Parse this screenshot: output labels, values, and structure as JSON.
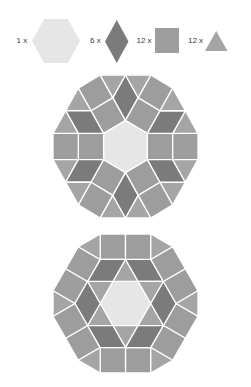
{
  "colors": {
    "hexagon": "#e6e6e6",
    "rhombus": "#7b7b7b",
    "square": "#9d9d9d",
    "triangle": "#a5a5a5",
    "gap": "#ffffff"
  },
  "legend": {
    "items": [
      {
        "count_label": "1 x",
        "count": 1,
        "shape": "hexagon"
      },
      {
        "count_label": "6 x",
        "count": 6,
        "shape": "rhombus"
      },
      {
        "count_label": "12 x",
        "count": 12,
        "shape": "square"
      },
      {
        "count_label": "12 x",
        "count": 12,
        "shape": "triangle"
      }
    ]
  },
  "figures": [
    {
      "name": "dodecagon-dissection-1",
      "description": "Pointy-top hexagon in center, squares on its edges, rhombi at its vertices, outer ring of squares and triangles",
      "rotations": 6,
      "hexagon": [
        [
          0,
          1
        ],
        [
          0.866,
          0.5
        ],
        [
          0.866,
          -0.5
        ],
        [
          0,
          -1
        ],
        [
          -0.866,
          -0.5
        ],
        [
          -0.866,
          0.5
        ]
      ],
      "sector": [
        {
          "shape": "square",
          "points": [
            [
              -0.866,
              0.5
            ],
            [
              0,
              1
            ],
            [
              -0.5,
              1.866
            ],
            [
              -1.366,
              1.366
            ]
          ]
        },
        {
          "shape": "rhombus",
          "points": [
            [
              0,
              1
            ],
            [
              0.5,
              1.866
            ],
            [
              0,
              2.732
            ],
            [
              -0.5,
              1.866
            ]
          ]
        },
        {
          "shape": "square",
          "points": [
            [
              -1.366,
              1.366
            ],
            [
              -0.5,
              1.866
            ],
            [
              -1,
              2.732
            ],
            [
              -1.866,
              2.232
            ]
          ]
        },
        {
          "shape": "triangle",
          "points": [
            [
              -0.5,
              1.866
            ],
            [
              0,
              2.732
            ],
            [
              -1,
              2.732
            ]
          ]
        },
        {
          "shape": "triangle",
          "points": [
            [
              -2.366,
              1.366
            ],
            [
              -1.366,
              1.366
            ],
            [
              -1.866,
              2.232
            ]
          ]
        }
      ]
    },
    {
      "name": "dodecagon-dissection-2",
      "description": "Flat-top hexagon in center with triangles forming a star, rhombi between star points, outer ring of paired squares and triangles",
      "rotations": 6,
      "hexagon": [
        [
          1,
          0
        ],
        [
          0.5,
          0.866
        ],
        [
          -0.5,
          0.866
        ],
        [
          -1,
          0
        ],
        [
          -0.5,
          -0.866
        ],
        [
          0.5,
          -0.866
        ]
      ],
      "sector": [
        {
          "shape": "triangle",
          "points": [
            [
              -0.5,
              0.866
            ],
            [
              0.5,
              0.866
            ],
            [
              0,
              1.732
            ]
          ]
        },
        {
          "shape": "rhombus",
          "points": [
            [
              0.5,
              0.866
            ],
            [
              1.5,
              0.866
            ],
            [
              1,
              1.732
            ],
            [
              0,
              1.732
            ]
          ]
        },
        {
          "shape": "square",
          "points": [
            [
              -1,
              1.732
            ],
            [
              0,
              1.732
            ],
            [
              0,
              2.732
            ],
            [
              -1,
              2.732
            ]
          ]
        },
        {
          "shape": "square",
          "points": [
            [
              0,
              1.732
            ],
            [
              1,
              1.732
            ],
            [
              1,
              2.732
            ],
            [
              0,
              2.732
            ]
          ]
        },
        {
          "shape": "triangle",
          "points": [
            [
              1,
              1.732
            ],
            [
              1,
              2.732
            ],
            [
              1.866,
              2.232
            ]
          ]
        }
      ]
    }
  ]
}
